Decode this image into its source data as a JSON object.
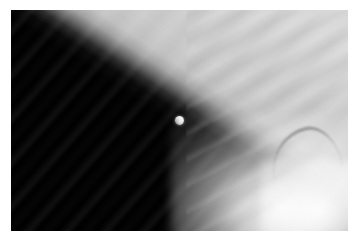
{
  "image": {
    "title": "Earth limb with Moon from orbit",
    "medium": "photograph",
    "orientation": "landscape",
    "border_color": "#ffffff",
    "space_color": "#030303",
    "earth_bright_color": "#ffffff",
    "earth_mid_color": "#c8c8c8",
    "moon_color": "#ededed",
    "caption": ""
  },
  "scene": {
    "background_label": "black space",
    "subjects": [
      {
        "name": "moon",
        "label": "Moon",
        "shape": "disc",
        "position": {
          "x": 179,
          "y": 125
        },
        "diameter_px": 9,
        "brightness": "bright grey-white, gibbous"
      },
      {
        "name": "earth-limb",
        "label": "Earth limb",
        "shape": "diagonal band",
        "angle_deg": -56.5,
        "terminator_top": {
          "x": 320,
          "y": 12
        },
        "terminator_bottom": {
          "x": 175,
          "y": 232
        },
        "brightness": "dark-to-white gradient"
      },
      {
        "name": "cloud-field",
        "label": "Cloud bands",
        "shape": "wispy streaks",
        "brightness": "white over grey"
      }
    ]
  },
  "frame": {
    "left": 11,
    "top": 10,
    "width": 337,
    "height": 221,
    "mat_label": "white photo border"
  }
}
